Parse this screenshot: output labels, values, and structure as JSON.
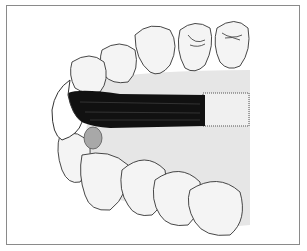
{
  "figure": {
    "colors": {
      "background": "#ffffff",
      "frame": "#8a8a8a",
      "gum_shading": "#e6e6e6",
      "tooth_fill": "#f4f4f4",
      "outline": "#333333",
      "bristles": "#111111",
      "handle": "#f0f0f0",
      "plaque": "#a8a8a8"
    }
  }
}
